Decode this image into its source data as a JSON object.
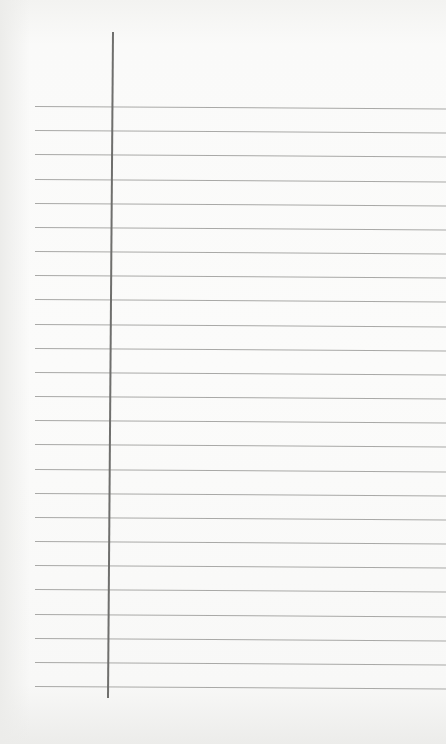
{
  "scene": {
    "description": "Blank sheet of ruled notebook paper with a vertical margin line",
    "paper_color": "#fbfbfa",
    "rule_color": "#a9a9a7",
    "margin_line_color": "#6f6f6d",
    "rule_count": 25,
    "rule_first_y": 106,
    "rule_spacing": 24.17,
    "margin_line": {
      "top_x": 112,
      "top_y": 32,
      "bottom_x": 107,
      "bottom_y": 698
    }
  }
}
